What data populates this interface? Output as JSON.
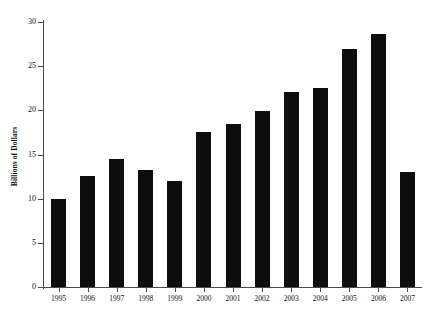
{
  "chart_data": {
    "type": "bar",
    "title": "",
    "subtitle": "",
    "xlabel": "",
    "ylabel": "Billions of Dollars",
    "categories": [
      "1995",
      "1996",
      "1997",
      "1998",
      "1999",
      "2000",
      "2001",
      "2002",
      "2003",
      "2004",
      "2005",
      "2006",
      "2007"
    ],
    "values": [
      10.0,
      12.6,
      14.5,
      13.3,
      12.0,
      17.6,
      18.4,
      19.9,
      22.1,
      22.5,
      26.9,
      28.6,
      13.0
    ],
    "ylim": [
      0,
      30
    ],
    "yticks": [
      0,
      5,
      10,
      15,
      20,
      25,
      30
    ],
    "ytick_labels": [
      "0",
      "5",
      "10",
      "15",
      "20",
      "25",
      "30"
    ],
    "grid": false,
    "legend": null,
    "legend_position": "none",
    "series": [
      {
        "name": "Billions of Dollars",
        "values": [
          10.0,
          12.6,
          14.5,
          13.3,
          12.0,
          17.6,
          18.4,
          19.9,
          22.1,
          22.5,
          26.9,
          28.6,
          13.0
        ]
      }
    ],
    "bar_color": "#0d0d0d",
    "axis_color": "#4a4a4a",
    "background_color": "#ffffff"
  }
}
